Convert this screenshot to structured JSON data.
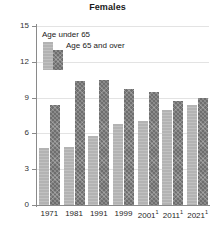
{
  "chart": {
    "title": "Females",
    "legend": {
      "position": "top-left-inside",
      "items": [
        {
          "label": "Age under 65",
          "swatch": "light-gray",
          "color": "#b3b3b3"
        },
        {
          "label": "Age 65 and over",
          "swatch": "dark-hatched",
          "color": "#6e6e6e"
        }
      ]
    },
    "y_ticks": [
      "0",
      "3",
      "6",
      "9",
      "12",
      "15"
    ],
    "x_labels": [
      {
        "year": "1971",
        "note": ""
      },
      {
        "year": "1981",
        "note": ""
      },
      {
        "year": "1991",
        "note": ""
      },
      {
        "year": "1999",
        "note": ""
      },
      {
        "year": "2001",
        "note": "1"
      },
      {
        "year": "2011",
        "note": "1"
      },
      {
        "year": "2021",
        "note": "1"
      }
    ]
  },
  "chart_data": {
    "type": "bar",
    "title": "Females",
    "xlabel": "",
    "ylabel": "",
    "ylim": [
      0,
      15
    ],
    "yticks": [
      0,
      3,
      6,
      9,
      12,
      15
    ],
    "grid": true,
    "legend_position": "upper left",
    "categories": [
      "1971",
      "1981",
      "1991",
      "1999",
      "2001¹",
      "2011¹",
      "2021¹"
    ],
    "series": [
      {
        "name": "Age under 65",
        "color": "#b3b3b3",
        "values": [
          4.8,
          4.9,
          5.8,
          6.8,
          7.0,
          8.0,
          8.4
        ]
      },
      {
        "name": "Age 65 and over",
        "color": "#6e6e6e",
        "values": [
          8.4,
          10.4,
          10.5,
          9.7,
          9.5,
          8.7,
          9.0
        ]
      }
    ]
  }
}
